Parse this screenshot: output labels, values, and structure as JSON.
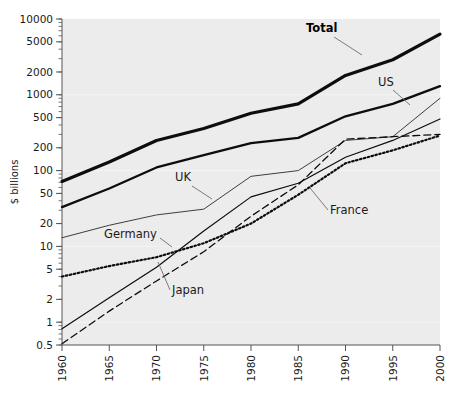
{
  "chart_data": {
    "type": "line",
    "title": "",
    "xlabel": "",
    "ylabel": "$ billions",
    "xlim": [
      1960,
      2000
    ],
    "ylim": [
      0.5,
      10000
    ],
    "yscale": "log",
    "grid": false,
    "legend_position": "inline-annotations",
    "x_ticks": [
      "1960",
      "1965",
      "1970",
      "1975",
      "1980",
      "1985",
      "1990",
      "1995",
      "2000"
    ],
    "y_ticks": [
      "0.5",
      "1",
      "2",
      "5",
      "10",
      "20",
      "50",
      "100",
      "200",
      "500",
      "1000",
      "2000",
      "5000",
      "10000"
    ],
    "x": [
      1960,
      1965,
      1970,
      1975,
      1980,
      1985,
      1990,
      1995,
      2000
    ],
    "series": [
      {
        "name": "Total",
        "style": "solid-bold",
        "values": [
          72,
          130,
          250,
          360,
          570,
          760,
          1800,
          2900,
          6300
        ]
      },
      {
        "name": "US",
        "style": "solid-medium",
        "values": [
          33,
          58,
          110,
          160,
          230,
          270,
          520,
          760,
          1300
        ]
      },
      {
        "name": "Germany",
        "style": "solid-thin",
        "values": [
          13,
          19,
          26,
          31,
          84,
          100,
          250,
          280,
          900
        ]
      },
      {
        "name": "Japan",
        "style": "dashed",
        "values": [
          0.52,
          1.4,
          3.5,
          8.5,
          25,
          65,
          260,
          280,
          300
        ]
      },
      {
        "name": "UK",
        "style": "solid-thin-2",
        "values": [
          0.82,
          2.1,
          5.3,
          16,
          45,
          68,
          150,
          250,
          480
        ]
      },
      {
        "name": "France",
        "style": "dotted",
        "values": [
          4.0,
          5.5,
          7.2,
          11,
          20,
          48,
          125,
          185,
          290
        ]
      }
    ],
    "annotations": [
      {
        "label": "Total",
        "bold": true,
        "x": 306,
        "y": 32,
        "leader": [
          [
            334,
            37
          ],
          [
            362,
            55
          ]
        ]
      },
      {
        "label": "US",
        "bold": false,
        "x": 378,
        "y": 86,
        "leader": [
          [
            393,
            90
          ],
          [
            410,
            105
          ]
        ]
      },
      {
        "label": "UK",
        "bold": false,
        "x": 175,
        "y": 181,
        "leader": [
          [
            192,
            186
          ],
          [
            212,
            199
          ]
        ]
      },
      {
        "label": "France",
        "bold": false,
        "x": 330,
        "y": 214,
        "leader": [
          [
            328,
            210
          ],
          [
            310,
            188
          ]
        ]
      },
      {
        "label": "Germany",
        "bold": false,
        "x": 104,
        "y": 238,
        "leader": [
          [
            160,
            238
          ],
          [
            172,
            247
          ]
        ]
      },
      {
        "label": "Japan",
        "bold": false,
        "x": 172,
        "y": 294,
        "leader": [
          [
            170,
            290
          ],
          [
            158,
            262
          ]
        ]
      }
    ]
  },
  "axis": {
    "y_title": "$ billions"
  }
}
